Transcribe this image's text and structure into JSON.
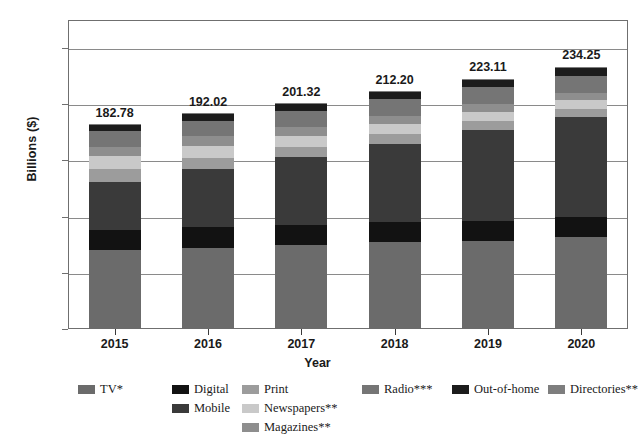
{
  "chart_data": {
    "type": "bar",
    "subtype": "stacked-bar",
    "title": "",
    "xlabel": "Year",
    "ylabel": "Billions ($)",
    "categories": [
      "2015",
      "2016",
      "2017",
      "2018",
      "2019",
      "2020"
    ],
    "ylim": [
      0,
      275
    ],
    "yticks": [
      0,
      50,
      100,
      150,
      200,
      250
    ],
    "ytick_labels": [
      "0",
      "50",
      "100",
      "150",
      "200",
      "250"
    ],
    "grid": "horizontal",
    "legend_position": "bottom",
    "totals": [
      182.78,
      192.02,
      201.32,
      212.2,
      223.11,
      234.25
    ],
    "total_labels": [
      "182.78",
      "192.02",
      "201.32",
      "212.20",
      "223.11",
      "234.25"
    ],
    "series": [
      {
        "name": "TV*",
        "color": "#6b6b6b",
        "values": [
          70.0,
          72.5,
          75.0,
          77.0,
          78.5,
          81.5
        ]
      },
      {
        "name": "Digital",
        "color": "#121212",
        "values": [
          18.0,
          18.0,
          18.0,
          18.0,
          18.0,
          18.0
        ]
      },
      {
        "name": "Mobile",
        "color": "#3a3a3a",
        "values": [
          43.0,
          52.0,
          60.0,
          70.0,
          81.0,
          89.5
        ]
      },
      {
        "name": "Print",
        "color": "#9c9c9c",
        "values": [
          11.8,
          10.0,
          9.3,
          8.5,
          7.7,
          7.0
        ]
      },
      {
        "name": "Newspapers**",
        "color": "#c9c9c9",
        "values": [
          11.0,
          10.5,
          9.5,
          9.0,
          8.0,
          7.5
        ]
      },
      {
        "name": "Magazines**",
        "color": "#8e8e8e",
        "values": [
          8.5,
          8.5,
          8.0,
          7.5,
          7.0,
          6.5
        ]
      },
      {
        "name": "Radio***",
        "color": "#757575",
        "values": [
          14.0,
          14.0,
          14.5,
          14.5,
          15.0,
          15.0
        ]
      },
      {
        "name": "Out-of-home",
        "color": "#1c1c1c",
        "values": [
          5.5,
          5.5,
          6.0,
          6.5,
          6.8,
          7.2
        ]
      },
      {
        "name": "Directories**",
        "color": "#7e7e7e",
        "values": [
          1.0,
          1.0,
          1.0,
          1.0,
          1.0,
          1.0
        ]
      }
    ]
  },
  "legend": {
    "items": [
      {
        "label": "TV*",
        "color": "#6b6b6b"
      },
      {
        "label": "Digital",
        "color": "#121212"
      },
      {
        "label": "Mobile",
        "color": "#3a3a3a"
      },
      {
        "label": "Print",
        "color": "#9c9c9c"
      },
      {
        "label": "Newspapers**",
        "color": "#c9c9c9"
      },
      {
        "label": "Magazines**",
        "color": "#8e8e8e"
      },
      {
        "label": "Radio***",
        "color": "#757575"
      },
      {
        "label": "Out-of-home",
        "color": "#1c1c1c"
      },
      {
        "label": "Directories**",
        "color": "#7e7e7e"
      }
    ]
  },
  "axes": {
    "y_title": "Billions ($)",
    "x_title": "Year"
  }
}
